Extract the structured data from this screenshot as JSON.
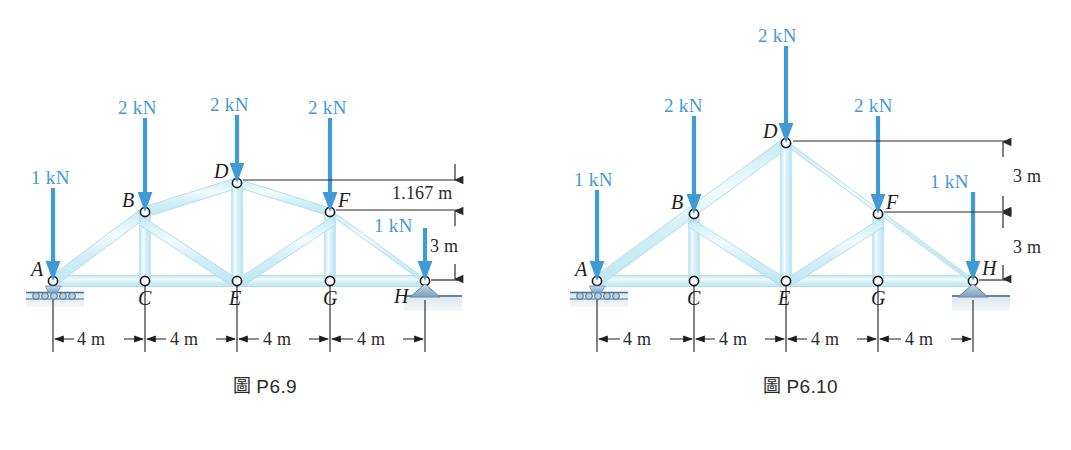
{
  "figures": [
    {
      "id": "P6.9",
      "caption": "P6.9",
      "caption_glyph": "圖",
      "truss_type": "arched-top-chord truss",
      "nodes": [
        {
          "label": "A",
          "x": 53,
          "y": 281
        },
        {
          "label": "B",
          "x": 145,
          "y": 212
        },
        {
          "label": "C",
          "x": 145,
          "y": 281
        },
        {
          "label": "D",
          "x": 237,
          "y": 183
        },
        {
          "label": "E",
          "x": 237,
          "y": 281
        },
        {
          "label": "F",
          "x": 330,
          "y": 212
        },
        {
          "label": "G",
          "x": 330,
          "y": 281
        },
        {
          "label": "H",
          "x": 425,
          "y": 281
        }
      ],
      "loads": [
        {
          "node": "A",
          "value": "1 kN",
          "label_x": 31,
          "label_y": 168
        },
        {
          "node": "B",
          "value": "2 kN",
          "label_x": 118,
          "label_y": 98
        },
        {
          "node": "D",
          "value": "2 kN",
          "label_x": 210,
          "label_y": 95
        },
        {
          "node": "F",
          "value": "2 kN",
          "label_x": 308,
          "label_y": 98
        },
        {
          "node": "H",
          "value": "1 kN",
          "label_x": 374,
          "label_y": 216
        }
      ],
      "supports": [
        {
          "node": "A",
          "type": "roller"
        },
        {
          "node": "H",
          "type": "pin"
        }
      ],
      "vertical_dimensions": [
        {
          "value": "1.167 m",
          "from": "D level",
          "to": "F level"
        },
        {
          "value": "3 m",
          "from": "F level",
          "to": "H level"
        }
      ],
      "horizontal_dimensions": [
        "4 m",
        "4 m",
        "4 m",
        "4 m"
      ]
    },
    {
      "id": "P6.10",
      "caption": "P6.10",
      "caption_glyph": "圖",
      "truss_type": "gable (triangular) truss",
      "nodes": [
        {
          "label": "A",
          "x": 67,
          "y": 281
        },
        {
          "label": "B",
          "x": 164,
          "y": 214
        },
        {
          "label": "C",
          "x": 164,
          "y": 281
        },
        {
          "label": "D",
          "x": 256,
          "y": 143
        },
        {
          "label": "E",
          "x": 256,
          "y": 281
        },
        {
          "label": "F",
          "x": 348,
          "y": 214
        },
        {
          "label": "G",
          "x": 348,
          "y": 281
        },
        {
          "label": "H",
          "x": 443,
          "y": 281
        }
      ],
      "loads": [
        {
          "node": "A",
          "value": "1 kN",
          "label_x": 44,
          "label_y": 170
        },
        {
          "node": "B",
          "value": "2 kN",
          "label_x": 134,
          "label_y": 96
        },
        {
          "node": "D",
          "value": "2 kN",
          "label_x": 228,
          "label_y": 26
        },
        {
          "node": "F",
          "value": "2 kN",
          "label_x": 324,
          "label_y": 96
        },
        {
          "node": "H",
          "value": "1 kN",
          "label_x": 400,
          "label_y": 172
        }
      ],
      "supports": [
        {
          "node": "A",
          "type": "roller"
        },
        {
          "node": "H",
          "type": "pin"
        }
      ],
      "vertical_dimensions": [
        {
          "value": "3 m",
          "from": "D level",
          "to": "F level"
        },
        {
          "value": "3 m",
          "from": "F level",
          "to": "H level"
        }
      ],
      "horizontal_dimensions": [
        "4 m",
        "4 m",
        "4 m",
        "4 m"
      ]
    }
  ],
  "colors": {
    "load_arrow": "#3f9ad6",
    "load_text": "#3f9ad6",
    "member_fill": "#d7eff7",
    "member_edge": "#b6e2ef",
    "dimension_line": "#2a2a2a",
    "node_outline": "#1d1d1d",
    "support_fill": "#a9c3d8",
    "ground_fill": "#e3ebef",
    "background": "#ffffff"
  }
}
